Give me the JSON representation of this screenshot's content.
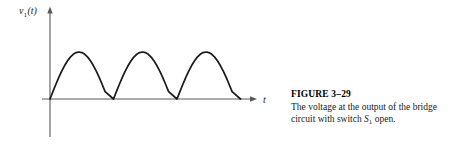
{
  "figure": {
    "caption_title": "FIGURE 3–29",
    "caption_line_1": "The voltage at the output of the",
    "caption_line_2_pre": "bridge circuit with switch ",
    "caption_line_2_symbol": "S",
    "caption_line_2_subscript": "1",
    "caption_line_2_post": " open.",
    "y_axis_label_symbol": "v",
    "y_axis_label_subscript": "1",
    "y_axis_label_arg": "(t)",
    "x_axis_label": "t",
    "line_color": "#1a1a1a",
    "axis_color": "#595959",
    "background_color": "#ffffff"
  },
  "chart_data": {
    "type": "line",
    "title": "",
    "subtitle": "",
    "xlabel": "t",
    "ylabel": "v₁(t)",
    "legend": [],
    "legend_position": "none",
    "grid": false,
    "waveform": "full-wave-rectified-sine",
    "amplitude": 1.0,
    "half_period": 1.0,
    "num_arches": 3,
    "xlim": [
      0,
      4.05
    ],
    "ylim": [
      0,
      1.18
    ],
    "axis_origin_px": [
      50,
      99
    ],
    "peak_px_y": 52,
    "zero_crossings_t": [
      0,
      1,
      2,
      3
    ],
    "peaks_t": [
      0.5,
      1.5,
      2.5
    ],
    "peaks_v": [
      1.0,
      1.0,
      1.0
    ],
    "series": [
      {
        "name": "v1(t)",
        "x": [
          0.0,
          0.05,
          0.1,
          0.15,
          0.2,
          0.25,
          0.3,
          0.35,
          0.4,
          0.45,
          0.5,
          0.55,
          0.6,
          0.65,
          0.7,
          0.75,
          0.8,
          0.85,
          0.9,
          0.95,
          1.0,
          1.05,
          1.1,
          1.15,
          1.2,
          1.25,
          1.3,
          1.35,
          1.4,
          1.45,
          1.5,
          1.55,
          1.6,
          1.65,
          1.7,
          1.75,
          1.8,
          1.85,
          1.9,
          1.95,
          2.0,
          2.05,
          2.1,
          2.15,
          2.2,
          2.25,
          2.3,
          2.35,
          2.4,
          2.45,
          2.5,
          2.55,
          2.6,
          2.65,
          2.7,
          2.75,
          2.8,
          2.85,
          2.9,
          2.95,
          3.0
        ],
        "y": [
          0.0,
          0.156,
          0.309,
          0.454,
          0.588,
          0.707,
          0.809,
          0.891,
          0.951,
          0.988,
          1.0,
          0.988,
          0.951,
          0.891,
          0.809,
          0.707,
          0.588,
          0.454,
          0.309,
          0.156,
          0.0,
          0.156,
          0.309,
          0.454,
          0.588,
          0.707,
          0.809,
          0.891,
          0.951,
          0.988,
          1.0,
          0.988,
          0.951,
          0.891,
          0.809,
          0.707,
          0.588,
          0.454,
          0.309,
          0.156,
          0.0,
          0.156,
          0.309,
          0.454,
          0.588,
          0.707,
          0.809,
          0.891,
          0.951,
          0.988,
          1.0,
          0.988,
          0.951,
          0.891,
          0.809,
          0.707,
          0.588,
          0.454,
          0.309,
          0.156,
          0.0
        ]
      }
    ]
  }
}
